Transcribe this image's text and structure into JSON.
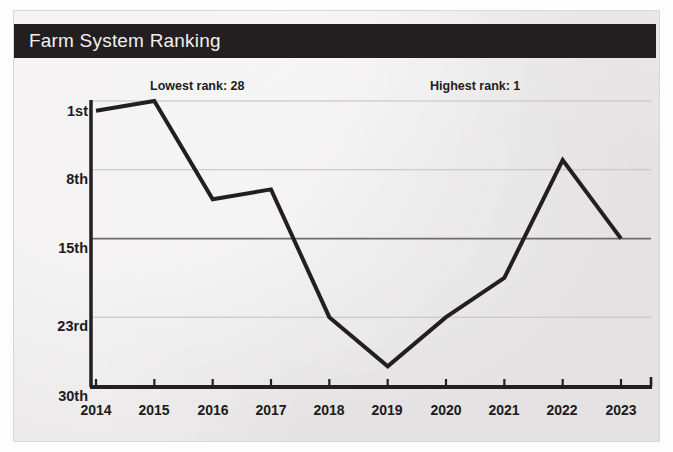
{
  "card": {
    "title": "Farm System Ranking",
    "title_bg": "#231f20",
    "title_color": "#f2f0ee",
    "background": "#eceaea"
  },
  "annotations": [
    {
      "id": "lowest",
      "text": "Lowest rank: 28"
    },
    {
      "id": "highest",
      "text": "Highest rank: 1"
    }
  ],
  "axis": {
    "y_ticks": [
      "1st",
      "8th",
      "15th",
      "23rd",
      "30th"
    ],
    "x_ticks": [
      "2014",
      "2015",
      "2016",
      "2017",
      "2018",
      "2019",
      "2020",
      "2021",
      "2022",
      "2023"
    ]
  },
  "chart_data": {
    "type": "line",
    "title": "Farm System Ranking",
    "xlabel": "",
    "ylabel": "",
    "x": [
      2014,
      2015,
      2016,
      2017,
      2018,
      2019,
      2020,
      2021,
      2022,
      2023
    ],
    "categories": [
      "2014",
      "2015",
      "2016",
      "2017",
      "2018",
      "2019",
      "2020",
      "2021",
      "2022",
      "2023"
    ],
    "values": [
      2,
      1,
      11,
      10,
      23,
      28,
      23,
      19,
      7,
      15
    ],
    "series": [
      {
        "name": "Farm System Ranking",
        "values": [
          2,
          1,
          11,
          10,
          23,
          28,
          23,
          19,
          7,
          15
        ],
        "color": "#231f20"
      }
    ],
    "y_tick_values": [
      1,
      8,
      15,
      23,
      30
    ],
    "y_tick_labels": [
      "1st",
      "8th",
      "15th",
      "23rd",
      "30th"
    ],
    "ylim": [
      1,
      30
    ],
    "y_inverted": true,
    "grid": "horizontal",
    "legend": "none",
    "annotations": [
      {
        "text": "Lowest rank: 28",
        "refers_to_year": 2019,
        "value": 28
      },
      {
        "text": "Highest rank: 1",
        "refers_to_year": 2015,
        "value": 1
      }
    ],
    "line_color": "#231f20",
    "line_width": 4
  }
}
